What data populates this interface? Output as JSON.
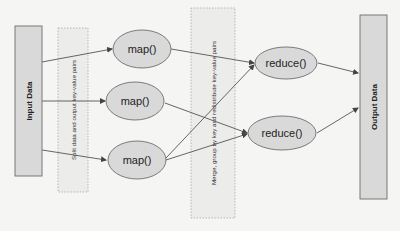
{
  "diagram": {
    "type": "mapreduce-flow",
    "input": {
      "label": "Input Data"
    },
    "output": {
      "label": "Output Data"
    },
    "phases": {
      "split": {
        "label": "Split data and output key-value pairs"
      },
      "merge": {
        "label": "Merge, group by key and redistribute key-value pairs"
      }
    },
    "map_nodes": [
      {
        "label": "map()"
      },
      {
        "label": "map()"
      },
      {
        "label": "map()"
      }
    ],
    "reduce_nodes": [
      {
        "label": "reduce()"
      },
      {
        "label": "reduce()"
      }
    ],
    "edges": [
      {
        "from": "Input Data",
        "to": "map() 1"
      },
      {
        "from": "Input Data",
        "to": "map() 2"
      },
      {
        "from": "Input Data",
        "to": "map() 3"
      },
      {
        "from": "map() 1",
        "to": "reduce() 1"
      },
      {
        "from": "map() 2",
        "to": "reduce() 2"
      },
      {
        "from": "map() 3",
        "to": "reduce() 1"
      },
      {
        "from": "map() 3",
        "to": "reduce() 2"
      },
      {
        "from": "reduce() 1",
        "to": "Output Data"
      },
      {
        "from": "reduce() 2",
        "to": "Output Data"
      }
    ],
    "colors": {
      "node_fill": "#d9d9d9",
      "node_stroke": "#6e6e6e",
      "phase_fill": "#ececea",
      "phase_stroke": "#a8a8a8",
      "edge": "#555555",
      "text": "#222222"
    }
  }
}
